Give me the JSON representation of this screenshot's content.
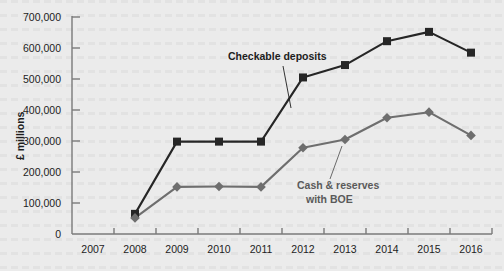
{
  "chart_data": {
    "type": "line",
    "title": "",
    "xlabel": "",
    "ylabel": "£ millions",
    "grid": false,
    "legend_position": "inline-annotation",
    "categories": [
      "2007",
      "2008",
      "2009",
      "2010",
      "2011",
      "2012",
      "2013",
      "2014",
      "2015",
      "2016"
    ],
    "x_tick_labels": [
      "2007",
      "2008",
      "2009",
      "2010",
      "2011",
      "2012",
      "2013",
      "2014",
      "2015",
      "2016"
    ],
    "y_tick_labels": [
      "0",
      "100,000",
      "200,000",
      "300,000",
      "400,000",
      "500,000",
      "600,000",
      "700,000"
    ],
    "y_tick_values": [
      0,
      100000,
      200000,
      300000,
      400000,
      500000,
      600000,
      700000
    ],
    "ylim": [
      0,
      700000
    ],
    "series": [
      {
        "name": "Checkable deposits",
        "color": "#262626",
        "marker": "square",
        "x": [
          "2008",
          "2009",
          "2010",
          "2011",
          "2012",
          "2013",
          "2014",
          "2015",
          "2016"
        ],
        "values": [
          65000,
          298000,
          298000,
          298000,
          505000,
          545000,
          622000,
          652000,
          585000
        ]
      },
      {
        "name": "Cash & reserves with BOE",
        "color": "#6e6e6e",
        "marker": "diamond",
        "x": [
          "2008",
          "2009",
          "2010",
          "2011",
          "2012",
          "2013",
          "2014",
          "2015",
          "2016"
        ],
        "values": [
          52000,
          152000,
          153000,
          152000,
          278000,
          305000,
          375000,
          393000,
          318000
        ]
      }
    ],
    "annotations": [
      {
        "text": "Checkable deposits",
        "series": "Checkable deposits",
        "color": "#1d1d1d",
        "text_x": 228,
        "text_y": 60,
        "text_anchor": "start",
        "leader_from_x": 283,
        "leader_from_y": 66,
        "leader_to_x": 291,
        "leader_to_y": 108
      },
      {
        "text_line1": "Cash & reserves",
        "text_line2": "with BOE",
        "series": "Cash & reserves with BOE",
        "color": "#5a5a5a",
        "text_x": 297,
        "text_y": 189,
        "text_anchor": "start",
        "leader_from_x": 330,
        "leader_from_y": 179,
        "leader_to_x": 342,
        "leader_to_y": 146
      }
    ]
  },
  "colors": {
    "background": "#ebebeb",
    "axis": "#7a7a7a",
    "text": "#1d1d1d",
    "series_checkable_deposits": "#262626",
    "series_cash_reserves": "#6e6e6e"
  },
  "annotation_labels": {
    "checkable_deposits": "Checkable deposits",
    "cash_reserves_line1": "Cash & reserves",
    "cash_reserves_line2": "with BOE"
  },
  "axis": {
    "y_title": "£ millions"
  }
}
